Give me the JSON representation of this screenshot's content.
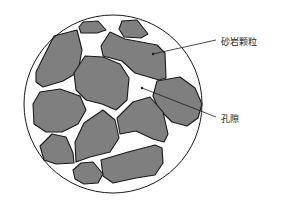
{
  "diagram": {
    "type": "sandstone-pore-structure",
    "colors": {
      "grain_fill": "#7f7f7f",
      "outline": "#1a1a1a",
      "background": "#ffffff"
    },
    "labels": {
      "grain": "砂岩颗粒",
      "pore": "孔隙"
    }
  }
}
